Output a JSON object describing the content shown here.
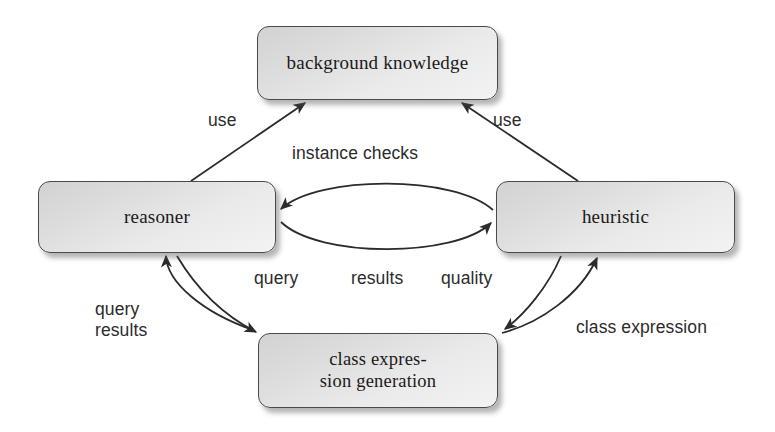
{
  "diagram": {
    "background_color": "#ffffff",
    "node_fill": "#e2e2e2",
    "node_border": "#4a4a4a",
    "arrow_color": "#2b2b2b",
    "text_color": "#1a1a1a",
    "nodes": [
      {
        "id": "background-knowledge",
        "label": "background knowledge",
        "x": 257,
        "y": 26,
        "w": 241,
        "h": 74
      },
      {
        "id": "reasoner",
        "label": "reasoner",
        "x": 38,
        "y": 181,
        "w": 238,
        "h": 72
      },
      {
        "id": "heuristic",
        "label": "heuristic",
        "x": 496,
        "y": 181,
        "w": 239,
        "h": 72
      },
      {
        "id": "class-expression-generation",
        "label": "class expres-\nsion generation",
        "x": 258,
        "y": 333,
        "w": 240,
        "h": 75
      }
    ],
    "edges": [
      {
        "id": "use-left",
        "label": "use",
        "from": "reasoner",
        "to": "background-knowledge",
        "style": "straight",
        "arrow": "single"
      },
      {
        "id": "use-right",
        "label": "use",
        "from": "heuristic",
        "to": "background-knowledge",
        "style": "straight",
        "arrow": "single"
      },
      {
        "id": "instance-checks",
        "label": "instance checks",
        "from": "heuristic",
        "to": "reasoner",
        "style": "curved",
        "arrow": "single"
      },
      {
        "id": "results",
        "label": "results",
        "from": "reasoner",
        "to": "heuristic",
        "style": "curved",
        "arrow": "single"
      },
      {
        "id": "query-results",
        "label": "query\nresults",
        "from": "class-expression-generation",
        "to": "reasoner",
        "style": "curved",
        "arrow": "single"
      },
      {
        "id": "query",
        "label": "query",
        "from": "reasoner",
        "to": "class-expression-generation",
        "style": "curved",
        "arrow": "single"
      },
      {
        "id": "quality",
        "label": "quality",
        "from": "heuristic",
        "to": "class-expression-generation",
        "style": "curved",
        "arrow": "single"
      },
      {
        "id": "class-expression",
        "label": "class expression",
        "from": "class-expression-generation",
        "to": "heuristic",
        "style": "curved",
        "arrow": "single"
      }
    ]
  }
}
